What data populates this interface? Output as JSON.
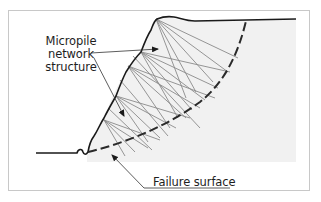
{
  "diagram": {
    "labels": {
      "micropile_line1": "Micropile",
      "micropile_line2": "network",
      "micropile_line3": "structure",
      "failure_surface": "Failure surface"
    },
    "colors": {
      "ground_line": "#1a1a1a",
      "soil_fill": "#f1f1f1",
      "pile_lines": "#8a8a8a",
      "failure_surface": "#2a2a2a",
      "frame_border": "#c8c8c8",
      "leader_lines": "#333333"
    },
    "elements": [
      "slope-profile",
      "micropile-fans",
      "failure-surface-dashed-arc",
      "leader-arrows"
    ]
  }
}
